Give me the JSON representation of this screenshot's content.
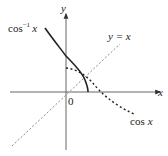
{
  "figure": {
    "axes": {
      "x_label": "x",
      "y_label": "y",
      "origin_label": "0"
    },
    "curves": [
      {
        "id": "arccos",
        "label_base": "cos",
        "label_sup": "−1",
        "label_var": "x",
        "style": "solid"
      },
      {
        "id": "cos",
        "label_base": "cos",
        "label_var": "x",
        "style": "dotted"
      },
      {
        "id": "identity",
        "label": "y = x",
        "style": "dashed"
      }
    ],
    "colors": {
      "axis": "#555555",
      "curve": "#222222",
      "dashed": "#777777"
    }
  }
}
